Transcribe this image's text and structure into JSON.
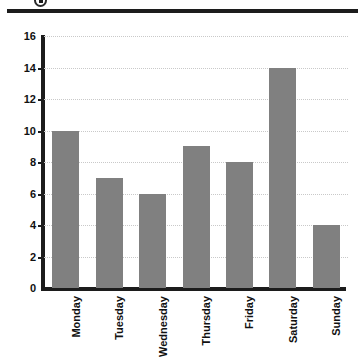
{
  "header": {
    "rule_present": true,
    "glyph_icon": "bullet-marker-icon"
  },
  "chart_data": {
    "type": "bar",
    "title": "",
    "subtitle": "",
    "xlabel": "",
    "ylabel": "",
    "categories": [
      "Monday",
      "Tuesday",
      "Wednesday",
      "Thursday",
      "Friday",
      "Saturday",
      "Sunday"
    ],
    "values": [
      10,
      7,
      6,
      9,
      8,
      14,
      4
    ],
    "ylim": [
      0,
      16
    ],
    "ytick_labels": [
      "0",
      "2",
      "4",
      "6",
      "8",
      "10",
      "12",
      "14",
      "16"
    ],
    "ytick_values": [
      0,
      2,
      4,
      6,
      8,
      10,
      12,
      14,
      16
    ],
    "grid": true,
    "grid_style": "dotted",
    "legend": "none",
    "bar_color": "#808080",
    "axis_color": "#1c1c1c",
    "grid_color": "#c9c9c9",
    "label_rotation": 90
  }
}
